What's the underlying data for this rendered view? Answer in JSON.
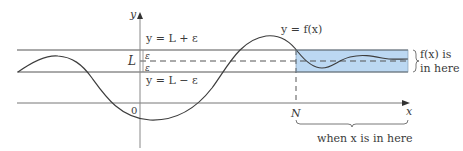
{
  "colors": {
    "line": "#555555",
    "curve": "#3d3d3d",
    "axis": "#7a7a7a",
    "band_fill": "#bcd8f2",
    "band_stroke": "#7a93a8",
    "text": "#3a3a3a"
  },
  "axes": {
    "y_label": "y",
    "x_label": "x",
    "origin_label": "0"
  },
  "band": {
    "upper_label": "y = L + ε",
    "lower_label": "y = L − ε",
    "center_label": "L",
    "epsilon_upper": "ε",
    "epsilon_lower": "ε"
  },
  "curve": {
    "label": "y = f(x)"
  },
  "threshold": {
    "label": "N"
  },
  "annotations": {
    "fx_region_line1": "f(x) is",
    "fx_region_line2": "in here",
    "x_region": "when x is in here"
  }
}
